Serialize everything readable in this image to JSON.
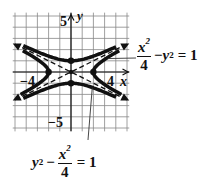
{
  "chart_data": {
    "type": "line",
    "title": "",
    "xlabel": "x",
    "ylabel": "y",
    "xlim": [
      -5,
      5
    ],
    "ylim": [
      -5,
      5
    ],
    "grid": true,
    "tick_labels": {
      "x": [
        "-4",
        "4"
      ],
      "y": [
        "5",
        "-5"
      ]
    },
    "series": [
      {
        "name": "x^2/4 - y^2 = 1",
        "kind": "hyperbola",
        "orientation": "horizontal",
        "a": 2,
        "b": 1,
        "vertices": [
          [
            -2,
            0
          ],
          [
            2,
            0
          ]
        ],
        "style": "solid-thick-arrows"
      },
      {
        "name": "y^2 - x^2/4 = 1",
        "kind": "hyperbola",
        "orientation": "vertical",
        "a": 1,
        "b": 2,
        "vertices": [
          [
            0,
            1
          ],
          [
            0,
            -1
          ]
        ],
        "style": "solid-thick-arrows"
      },
      {
        "name": "asymptotes",
        "kind": "lines",
        "equations": [
          "y = x/2",
          "y = -x/2"
        ],
        "style": "dashed"
      }
    ],
    "annotations": [
      {
        "text": "x^2/4 - y^2 = 1",
        "points_to": "right branch of horizontal hyperbola"
      },
      {
        "text": "y^2 - x^2/4 = 1",
        "points_to": "lower branch of vertical hyperbola"
      }
    ]
  },
  "labels": {
    "y_axis": "y",
    "x_axis": "x",
    "y_top": "5",
    "y_bottom": "−5",
    "x_left": "−4",
    "x_right": "4"
  },
  "equation1": {
    "num": "x",
    "exp": "2",
    "den": "4",
    "rest_var": "y",
    "rest_exp": "2",
    "minus": "−",
    "equals": "= 1"
  },
  "equation2": {
    "var": "y",
    "exp": "2",
    "minus": "−",
    "num": "x",
    "num_exp": "2",
    "den": "4",
    "equals": "= 1"
  }
}
